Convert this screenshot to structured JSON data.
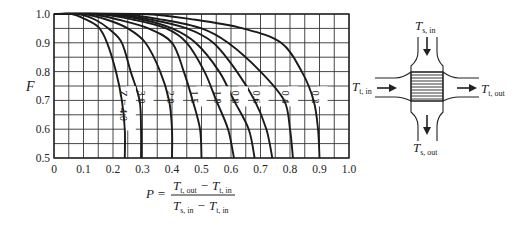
{
  "chart_data": {
    "type": "line",
    "title": "",
    "xlabel": "P",
    "ylabel": "F",
    "xlim": [
      0,
      1.0
    ],
    "ylim": [
      0.5,
      1.0
    ],
    "grid": true,
    "grid_minor_step_x": 0.05,
    "grid_minor_step_y": 0.05,
    "x_ticks": [
      "0",
      "0.1",
      "0.2",
      "0.3",
      "0.4",
      "0.5",
      "0.6",
      "0.7",
      "0.8",
      "0.9",
      "1.0"
    ],
    "y_ticks": [
      "0.5",
      "0.6",
      "0.7",
      "0.8",
      "0.9",
      "1.0"
    ],
    "series_parameter": "Z",
    "series": [
      {
        "name": "Z = 4.0",
        "label": "Z = 4.0",
        "points": [
          [
            0.0,
            1.0
          ],
          [
            0.06,
            1.0
          ],
          [
            0.1,
            0.985
          ],
          [
            0.15,
            0.955
          ],
          [
            0.18,
            0.9
          ],
          [
            0.21,
            0.8
          ],
          [
            0.23,
            0.7
          ],
          [
            0.24,
            0.6
          ],
          [
            0.24,
            0.5
          ]
        ]
      },
      {
        "name": "Z = 3.0",
        "label": "3.0",
        "points": [
          [
            0.0,
            1.0
          ],
          [
            0.08,
            1.0
          ],
          [
            0.14,
            0.98
          ],
          [
            0.19,
            0.945
          ],
          [
            0.23,
            0.9
          ],
          [
            0.26,
            0.8
          ],
          [
            0.29,
            0.7
          ],
          [
            0.295,
            0.6
          ],
          [
            0.295,
            0.5
          ]
        ]
      },
      {
        "name": "Z = 2.0",
        "label": "2.0",
        "points": [
          [
            0.0,
            1.0
          ],
          [
            0.1,
            1.0
          ],
          [
            0.18,
            0.98
          ],
          [
            0.25,
            0.95
          ],
          [
            0.31,
            0.9
          ],
          [
            0.36,
            0.8
          ],
          [
            0.39,
            0.7
          ],
          [
            0.4,
            0.6
          ],
          [
            0.4,
            0.5
          ]
        ]
      },
      {
        "name": "Z = 1.5",
        "label": "1.5",
        "points": [
          [
            0.0,
            1.0
          ],
          [
            0.12,
            1.0
          ],
          [
            0.22,
            0.98
          ],
          [
            0.32,
            0.95
          ],
          [
            0.4,
            0.9
          ],
          [
            0.44,
            0.8
          ],
          [
            0.47,
            0.7
          ],
          [
            0.495,
            0.6
          ],
          [
            0.5,
            0.5
          ]
        ]
      },
      {
        "name": "Z = 1.0",
        "label": "1.0",
        "points": [
          [
            0.0,
            1.0
          ],
          [
            0.15,
            1.0
          ],
          [
            0.27,
            0.98
          ],
          [
            0.38,
            0.95
          ],
          [
            0.45,
            0.9
          ],
          [
            0.51,
            0.8
          ],
          [
            0.55,
            0.7
          ],
          [
            0.59,
            0.6
          ],
          [
            0.61,
            0.5
          ]
        ]
      },
      {
        "name": "Z = 0.8",
        "label": "0.8",
        "points": [
          [
            0.0,
            1.0
          ],
          [
            0.17,
            1.0
          ],
          [
            0.3,
            0.98
          ],
          [
            0.4,
            0.95
          ],
          [
            0.48,
            0.9
          ],
          [
            0.56,
            0.8
          ],
          [
            0.61,
            0.7
          ],
          [
            0.66,
            0.6
          ],
          [
            0.68,
            0.5
          ]
        ]
      },
      {
        "name": "Z = 0.6",
        "label": "0.6",
        "points": [
          [
            0.0,
            1.0
          ],
          [
            0.19,
            1.0
          ],
          [
            0.33,
            0.98
          ],
          [
            0.45,
            0.95
          ],
          [
            0.54,
            0.9
          ],
          [
            0.62,
            0.8
          ],
          [
            0.68,
            0.7
          ],
          [
            0.72,
            0.6
          ],
          [
            0.74,
            0.5
          ]
        ]
      },
      {
        "name": "Z = 0.4",
        "label": "0.4",
        "points": [
          [
            0.0,
            1.0
          ],
          [
            0.22,
            1.0
          ],
          [
            0.37,
            0.98
          ],
          [
            0.5,
            0.95
          ],
          [
            0.59,
            0.9
          ],
          [
            0.7,
            0.8
          ],
          [
            0.78,
            0.7
          ],
          [
            0.8,
            0.6
          ],
          [
            0.81,
            0.5
          ]
        ]
      },
      {
        "name": "Z = 0.2",
        "label": "0.2",
        "points": [
          [
            0.0,
            1.0
          ],
          [
            0.3,
            1.0
          ],
          [
            0.48,
            0.98
          ],
          [
            0.64,
            0.95
          ],
          [
            0.77,
            0.9
          ],
          [
            0.84,
            0.8
          ],
          [
            0.88,
            0.7
          ],
          [
            0.895,
            0.6
          ],
          [
            0.9,
            0.5
          ]
        ]
      }
    ],
    "annotations": {
      "formula": "P = (T_t,out − T_t,in) / (T_s,in − T_t,in)"
    }
  },
  "axes": {
    "y_label": "F",
    "x_formula": {
      "lhs": "P =",
      "numerator": {
        "a": "T",
        "a_sub": "t, out",
        "op": "−",
        "b": "T",
        "b_sub": "t, in"
      },
      "denominator": {
        "a": "T",
        "a_sub": "s, in",
        "op": "−",
        "b": "T",
        "b_sub": "t, in"
      }
    }
  },
  "diagram": {
    "top_label": {
      "main": "T",
      "sub": "s, in"
    },
    "bottom_label": {
      "main": "T",
      "sub": "s, out"
    },
    "left_label": {
      "main": "T",
      "sub": "t, in"
    },
    "right_label": {
      "main": "T",
      "sub": "t, out"
    }
  },
  "colors": {
    "ink": "#1a1a1a",
    "grid": "#333333",
    "background": "#ffffff"
  }
}
